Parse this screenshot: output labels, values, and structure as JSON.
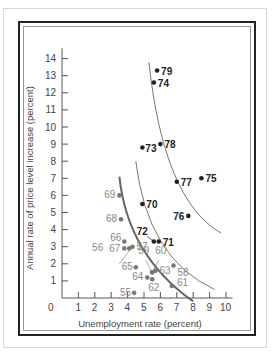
{
  "chart_data": {
    "type": "scatter",
    "title": "",
    "xlabel": "Unemployment rate (percent)",
    "ylabel": "Annual rate of price level increase (percent)",
    "xlim": [
      0,
      10
    ],
    "ylim": [
      0,
      14
    ],
    "x_ticks": [
      "0",
      "1",
      "2",
      "3",
      "4",
      "5",
      "6",
      "7",
      "8",
      "9",
      "10"
    ],
    "y_ticks": [
      "1",
      "2",
      "3",
      "4",
      "5",
      "6",
      "7",
      "8",
      "9",
      "10",
      "11",
      "12",
      "13",
      "14"
    ],
    "grid": false,
    "series": [
      {
        "name": "1955-1969 (grey)",
        "points": [
          {
            "label": "55",
            "x": 4.4,
            "y": 0.3
          },
          {
            "label": "56",
            "x": 4.1,
            "y": 2.9
          },
          {
            "label": "57",
            "x": 4.3,
            "y": 3.0
          },
          {
            "label": "58",
            "x": 6.8,
            "y": 1.9
          },
          {
            "label": "59",
            "x": 5.5,
            "y": 1.5
          },
          {
            "label": "60",
            "x": 5.5,
            "y": 1.5
          },
          {
            "label": "61",
            "x": 6.7,
            "y": 0.7
          },
          {
            "label": "62",
            "x": 5.5,
            "y": 1.1
          },
          {
            "label": "63",
            "x": 5.7,
            "y": 1.6
          },
          {
            "label": "64",
            "x": 5.2,
            "y": 1.2
          },
          {
            "label": "65",
            "x": 4.5,
            "y": 1.8
          },
          {
            "label": "66",
            "x": 3.8,
            "y": 3.3
          },
          {
            "label": "67",
            "x": 3.8,
            "y": 2.9
          },
          {
            "label": "68",
            "x": 3.6,
            "y": 4.6
          },
          {
            "label": "69",
            "x": 3.5,
            "y": 6.0
          }
        ]
      },
      {
        "name": "1970-1979 (black)",
        "points": [
          {
            "label": "70",
            "x": 4.9,
            "y": 5.5
          },
          {
            "label": "71",
            "x": 5.9,
            "y": 3.3
          },
          {
            "label": "72",
            "x": 5.6,
            "y": 3.3
          },
          {
            "label": "73",
            "x": 4.9,
            "y": 8.8
          },
          {
            "label": "74",
            "x": 5.6,
            "y": 12.6
          },
          {
            "label": "75",
            "x": 8.5,
            "y": 7.0
          },
          {
            "label": "76",
            "x": 7.7,
            "y": 4.8
          },
          {
            "label": "77",
            "x": 7.0,
            "y": 6.8
          },
          {
            "label": "78",
            "x": 6.0,
            "y": 9.0
          },
          {
            "label": "79",
            "x": 5.8,
            "y": 13.3
          }
        ]
      }
    ],
    "annotations": [
      "Three downward-sloping Phillips curves drawn through the point clusters"
    ]
  }
}
